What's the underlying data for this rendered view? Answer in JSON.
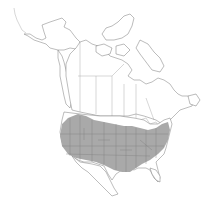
{
  "map": {
    "region": "North America",
    "type": "species range map",
    "range_label": "shaded range",
    "colors": {
      "background": "#ffffff",
      "land": "#ffffff",
      "outline": "#7a7a7a",
      "range_fill": "#a9a9a9"
    }
  }
}
